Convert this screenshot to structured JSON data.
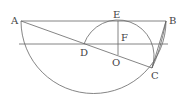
{
  "diagram": {
    "type": "geometry",
    "labels": {
      "A": "A",
      "B": "B",
      "C": "C",
      "D": "D",
      "E": "E",
      "F": "F",
      "O": "O"
    },
    "points": {
      "A": [
        21,
        21
      ],
      "B": [
        166,
        21
      ],
      "C": [
        152,
        68
      ],
      "D": [
        84,
        44
      ],
      "E": [
        118,
        21
      ],
      "O": [
        118,
        55
      ]
    },
    "stroke_color": "#666666"
  }
}
